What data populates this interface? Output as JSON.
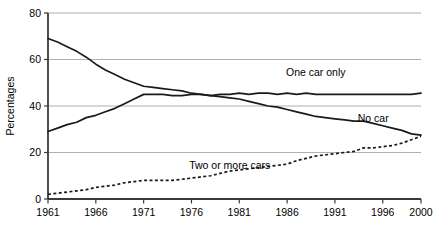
{
  "chart_data": {
    "type": "line",
    "title": "",
    "xlabel": "",
    "ylabel": "Percentages",
    "xlim": [
      1961,
      2000
    ],
    "ylim": [
      0,
      80
    ],
    "ytick_values": [
      0,
      20,
      40,
      60,
      80
    ],
    "ytick_labels": [
      "0",
      "20",
      "40",
      "60",
      "80"
    ],
    "xtick_values": [
      1961,
      1966,
      1971,
      1976,
      1981,
      1986,
      1991,
      1996,
      2000
    ],
    "xtick_labels": [
      "1961",
      "1966",
      "1971",
      "1976",
      "1981",
      "1986",
      "1991",
      "1996",
      "2000"
    ],
    "grid": "horizontal",
    "legend_position": "inline-annotations",
    "x": [
      1961,
      1962,
      1963,
      1964,
      1965,
      1966,
      1967,
      1968,
      1969,
      1970,
      1971,
      1972,
      1973,
      1974,
      1975,
      1976,
      1977,
      1978,
      1979,
      1980,
      1981,
      1982,
      1983,
      1984,
      1985,
      1986,
      1987,
      1988,
      1989,
      1990,
      1991,
      1992,
      1993,
      1994,
      1995,
      1996,
      1997,
      1998,
      1999,
      2000
    ],
    "series": [
      {
        "name": "No car",
        "style": "solid",
        "label": "No car",
        "label_x": 1995,
        "label_y": 33,
        "values": [
          69,
          67.5,
          65.5,
          63.5,
          61,
          58,
          55.5,
          53.5,
          51.5,
          50,
          48.5,
          48,
          47.5,
          47,
          46.5,
          45.5,
          45,
          44.5,
          44,
          43.5,
          43,
          42,
          41,
          40,
          39.5,
          38.5,
          37.5,
          36.5,
          35.5,
          35,
          34.5,
          34,
          33.5,
          33.5,
          32.5,
          31.5,
          30.5,
          29.5,
          28,
          27.5
        ]
      },
      {
        "name": "One car only",
        "style": "solid",
        "label": "One car only",
        "label_x": 1989,
        "label_y": 53,
        "values": [
          29,
          30.5,
          32,
          33,
          35,
          36,
          37.5,
          39,
          41,
          43,
          45,
          45,
          45,
          44.5,
          44.5,
          45,
          45,
          44.5,
          45,
          45,
          45.5,
          45,
          45.5,
          45.5,
          45,
          45.5,
          45,
          45.5,
          45,
          45,
          45,
          45,
          45,
          45,
          45,
          45,
          45,
          45,
          45,
          45.5
        ]
      },
      {
        "name": "Two or more cars",
        "style": "dotted",
        "label": "Two or more cars",
        "label_x": 1980,
        "label_y": 13,
        "values": [
          2,
          2.5,
          3,
          3.5,
          4,
          5,
          5.5,
          6,
          7,
          7.5,
          8,
          8,
          8,
          8,
          8.5,
          9,
          9.5,
          10,
          11,
          12,
          12.5,
          13,
          13.5,
          14,
          14.5,
          15,
          16.5,
          17.5,
          18.5,
          19,
          19.5,
          20,
          20.5,
          22,
          22,
          22.5,
          23,
          24,
          25.5,
          27
        ]
      }
    ]
  },
  "axis": {
    "ylabel": "Percentages"
  }
}
